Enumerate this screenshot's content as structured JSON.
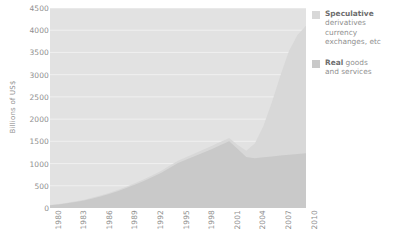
{
  "chart_data": {
    "type": "area",
    "stacked": true,
    "title": "",
    "xlabel": "",
    "ylabel": "Billions of US$",
    "ylim": [
      0,
      4500
    ],
    "xlim": [
      1980,
      2010
    ],
    "grid": true,
    "legend_position": "right",
    "y_ticks": [
      "4500",
      "4000",
      "3500",
      "3000",
      "2500",
      "2000",
      "1500",
      "1000",
      "500",
      "0"
    ],
    "y_tick_values": [
      4500,
      4000,
      3500,
      3000,
      2500,
      2000,
      1500,
      1000,
      500,
      0
    ],
    "x_ticks": [
      "1980",
      "1983",
      "1986",
      "1989",
      "1992",
      "1995",
      "1998",
      "2001",
      "2004",
      "2007",
      "2010"
    ],
    "x_tick_values": [
      1980,
      1983,
      1986,
      1989,
      1992,
      1995,
      1998,
      2001,
      2004,
      2007,
      2010
    ],
    "x": [
      1980,
      1981,
      1982,
      1983,
      1984,
      1985,
      1986,
      1987,
      1988,
      1989,
      1990,
      1991,
      1992,
      1993,
      1994,
      1995,
      1996,
      1997,
      1998,
      1999,
      2000,
      2001,
      2002,
      2003,
      2004,
      2005,
      2006,
      2007,
      2008,
      2009,
      2010
    ],
    "series": [
      {
        "name": "Real",
        "label": "Real goods and services",
        "color": "#c9c9c9",
        "values": [
          60,
          80,
          105,
          135,
          170,
          215,
          265,
          320,
          385,
          455,
          530,
          610,
          695,
          790,
          900,
          1010,
          1090,
          1170,
          1250,
          1330,
          1420,
          1500,
          1330,
          1150,
          1120,
          1140,
          1160,
          1180,
          1200,
          1215,
          1230
        ]
      },
      {
        "name": "Speculative",
        "label": "Speculative derivatives currency exchanges, etc",
        "color": "#d8d8d8",
        "values": [
          10,
          12,
          14,
          16,
          18,
          20,
          22,
          25,
          28,
          30,
          33,
          36,
          40,
          44,
          48,
          52,
          56,
          60,
          64,
          68,
          72,
          76,
          90,
          140,
          330,
          700,
          1220,
          1800,
          2330,
          2680,
          2870
        ]
      }
    ],
    "totals": [
      70,
      92,
      119,
      151,
      188,
      235,
      287,
      345,
      413,
      485,
      563,
      646,
      735,
      834,
      948,
      1062,
      1146,
      1230,
      1314,
      1398,
      1492,
      1576,
      1420,
      1290,
      1450,
      1840,
      2380,
      2980,
      3530,
      3895,
      4100
    ],
    "colors": {
      "plot_background": "#e2e2e2",
      "gridline": "#f0f0f0",
      "real_area": "#c9c9c9",
      "speculative_area": "#d8d8d8",
      "text": "#8f8f8f",
      "legend_title": "#6d6d6d"
    }
  },
  "axis": {
    "y_title": "Billions of US$"
  },
  "legend": {
    "entries": [
      {
        "title": "Speculative",
        "lines": [
          "derivatives",
          "currency",
          "exchanges, etc"
        ],
        "swatch": "#d8d8d8"
      },
      {
        "title": "Real",
        "inline": " goods",
        "lines": [
          "and services"
        ],
        "swatch": "#c9c9c9"
      }
    ]
  }
}
